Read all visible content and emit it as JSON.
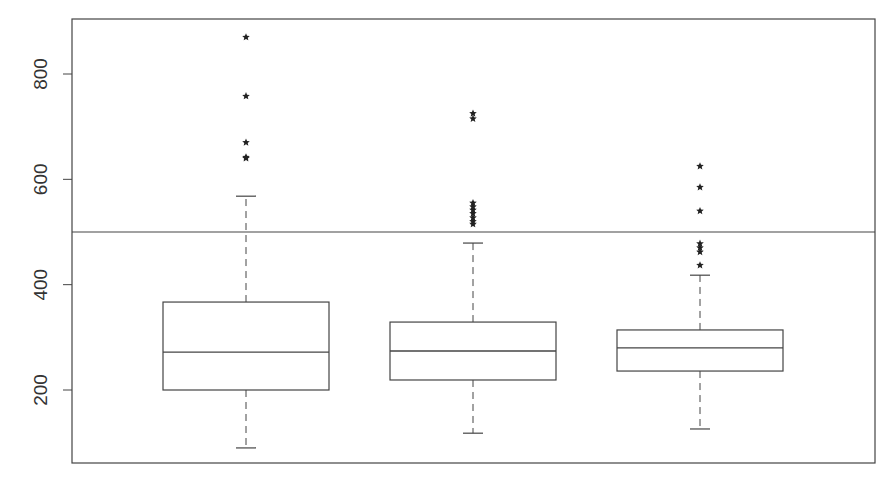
{
  "chart_data": {
    "type": "box",
    "title": "",
    "xlabel": "",
    "ylabel": "",
    "categories": [
      "",
      "",
      ""
    ],
    "ylim": [
      60,
      900
    ],
    "yticks": [
      200,
      400,
      600,
      800
    ],
    "ytick_labels": [
      "200",
      "400",
      "600",
      "800"
    ],
    "grid": false,
    "legend": null,
    "reference_line": {
      "y": 500,
      "orientation": "horizontal"
    },
    "series": [
      {
        "name": "Group 1",
        "whisker_low": 90,
        "q1": 200,
        "median": 272,
        "q3": 367,
        "whisker_high": 568,
        "outliers": [
          640,
          642,
          670,
          758,
          870
        ]
      },
      {
        "name": "Group 2",
        "whisker_low": 118,
        "q1": 219,
        "median": 274,
        "q3": 329,
        "whisker_high": 479,
        "outliers": [
          515,
          520,
          527,
          535,
          542,
          548,
          555,
          715,
          725
        ]
      },
      {
        "name": "Group 3",
        "whisker_low": 126,
        "q1": 236,
        "median": 280,
        "q3": 314,
        "whisker_high": 418,
        "outliers": [
          437,
          462,
          470,
          478,
          540,
          585,
          625
        ]
      }
    ],
    "outlier_marker": "star"
  },
  "colors": {
    "line": "#444444",
    "text": "#333333",
    "background": "#ffffff"
  }
}
